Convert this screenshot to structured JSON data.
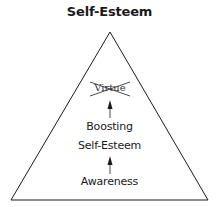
{
  "title": "Self-Esteem",
  "pyramid": {
    "levels": [
      {
        "label": "Virtue",
        "struck_out": true
      },
      {
        "label": "Boosting"
      },
      {
        "label": "Self-Esteem"
      },
      {
        "label": "Awareness"
      }
    ],
    "arrows": [
      {
        "from": "Awareness",
        "to": "Boosting Self-Esteem"
      },
      {
        "from": "Boosting Self-Esteem",
        "to": "Virtue"
      }
    ]
  },
  "colors": {
    "stroke": "#1a1a1a",
    "background": "#ffffff"
  }
}
